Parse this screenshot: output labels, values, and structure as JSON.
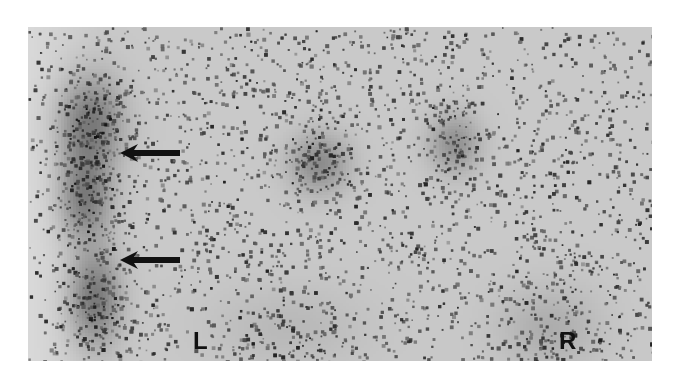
{
  "image": {
    "type": "scintigraphy-scan",
    "description": "Grayscale nuclear medicine scan with noisy speckle background showing areas of uptake",
    "labels": {
      "left": "L",
      "right": "R"
    },
    "annotations": [
      {
        "type": "arrow",
        "direction": "left",
        "target": "upper uptake on left structure"
      },
      {
        "type": "arrow",
        "direction": "left",
        "target": "lower uptake on left structure"
      }
    ],
    "colors": {
      "background": "#ffffff",
      "scan_base": "#d9d9d9",
      "uptake": "#2a2a2a",
      "text": "#111111"
    }
  }
}
